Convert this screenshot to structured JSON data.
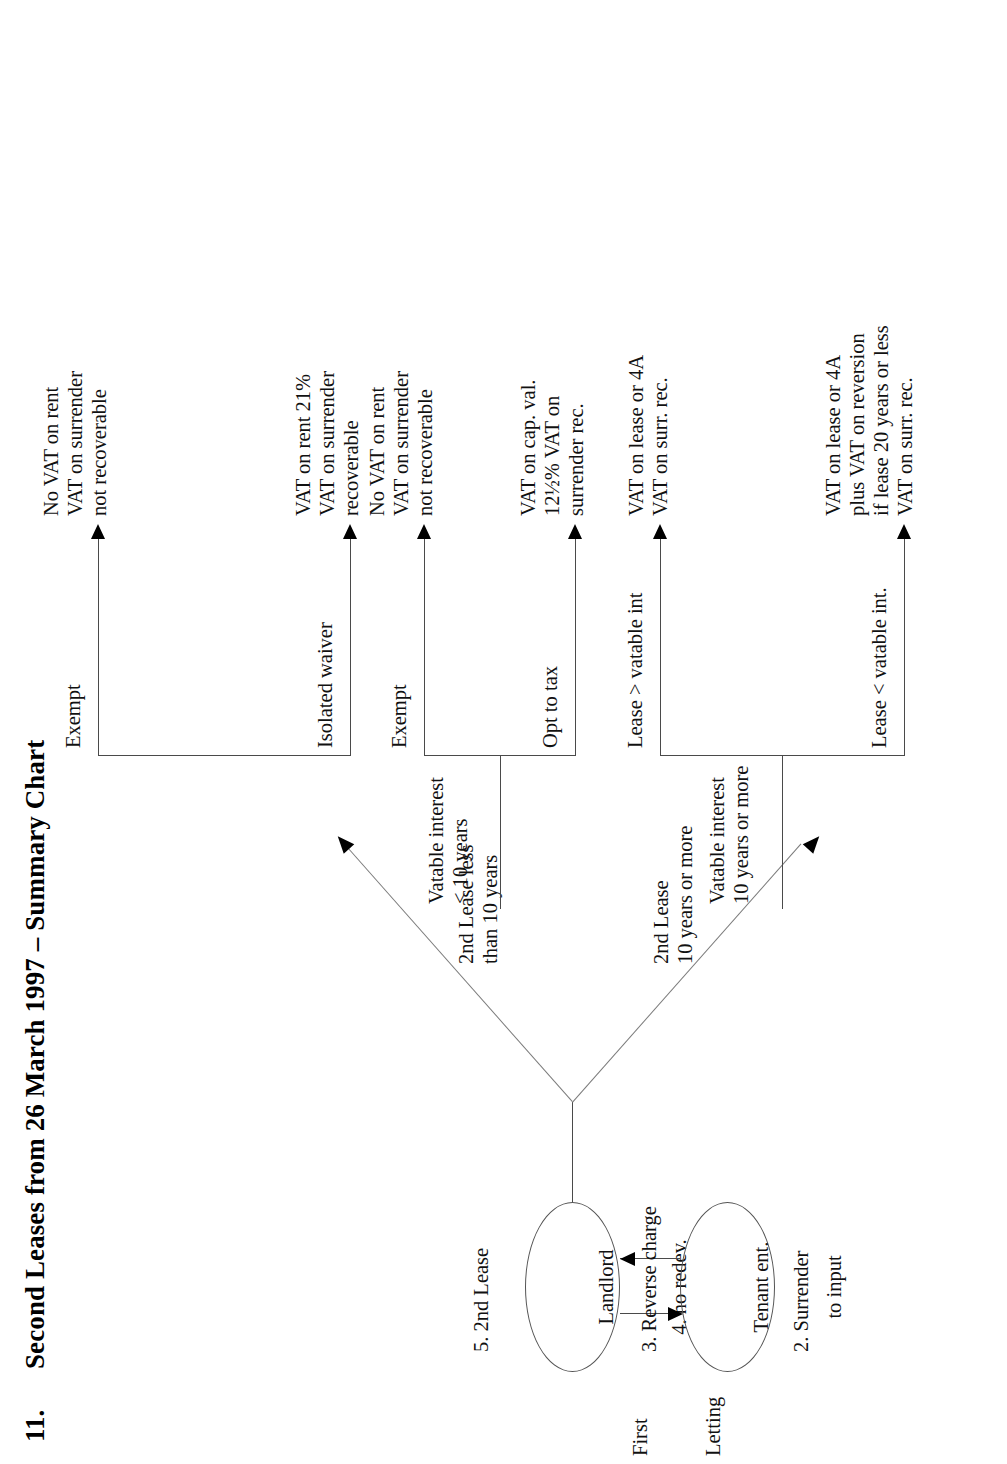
{
  "page": {
    "number": "11.",
    "title": "Second Leases from 26 March 1997 – Summary Chart",
    "orientation": "landscape-rotated-90ccw"
  },
  "nodes": {
    "landlord": {
      "line1": "Landlord",
      "line2": "4. no redev."
    },
    "tenant": {
      "line1": "Tenant ent.",
      "line2": "to input"
    }
  },
  "first_letting": {
    "line1": "First",
    "line2": "Letting"
  },
  "edge_labels": {
    "second_lease": "5. 2nd Lease",
    "reverse_charge": "3. Reverse charge",
    "surrender": "2. Surrender",
    "lease_less_10": "2nd Lease less\nthan 10 years",
    "lease_10_or_more": "2nd Lease\n10 years or more"
  },
  "branches": {
    "left": {
      "top_label": "Exempt",
      "bottom_label": "Isolated waiver"
    },
    "right_upper": {
      "stem_label": "Vatable interest\n< 10 years",
      "top_label": "Exempt",
      "bottom_label": "Opt to tax"
    },
    "right_lower": {
      "stem_label": "Vatable interest\n10 years or more",
      "top_label": "Lease > vatable int",
      "bottom_label": "Lease < vatable int."
    }
  },
  "outcomes": [
    {
      "id": "exempt-no-waiver",
      "lines": "No VAT on rent\nVAT on surrender\nnot recoverable"
    },
    {
      "id": "isolated-waiver",
      "lines": "VAT on rent 21%\nVAT on surrender\nrecoverable"
    },
    {
      "id": "exempt-short",
      "lines": "No VAT on rent\nVAT on surrender\nnot recoverable"
    },
    {
      "id": "opt-to-tax",
      "lines": "VAT on cap. val.\n12½% VAT on\nsurrender rec."
    },
    {
      "id": "lease-gt-vatable",
      "lines": "VAT on lease or 4A\nVAT on surr. rec."
    },
    {
      "id": "lease-lt-vatable",
      "lines": "VAT on lease or 4A\nplus VAT on reversion\nif lease 20 years or less\nVAT on surr. rec."
    }
  ]
}
